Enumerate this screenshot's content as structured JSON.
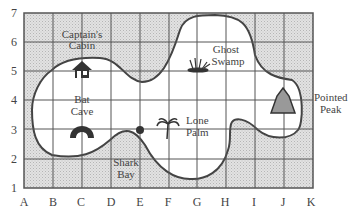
{
  "map": {
    "title": "",
    "grid": {
      "columns": [
        "A",
        "B",
        "C",
        "D",
        "E",
        "F",
        "G",
        "H",
        "I",
        "J",
        "K"
      ],
      "rows": [
        "1",
        "2",
        "3",
        "4",
        "5",
        "6",
        "7"
      ]
    },
    "landmarks": [
      {
        "id": "captains-cabin",
        "line1": "Captain's",
        "line2": "Cabin",
        "grid": "C5",
        "icon": "house-icon"
      },
      {
        "id": "bat-cave",
        "line1": "Bat",
        "line2": "Cave",
        "grid": "C3",
        "icon": "cave-icon"
      },
      {
        "id": "ghost-swamp",
        "line1": "Ghost",
        "line2": "Swamp",
        "grid": "G5",
        "icon": "swamp-grass-icon"
      },
      {
        "id": "lone-palm",
        "line1": "Lone",
        "line2": "Palm",
        "grid": "F3",
        "icon": "palm-tree-icon"
      },
      {
        "id": "pointed-peak",
        "line1": "Pointed",
        "line2": "Peak",
        "grid": "J4",
        "icon": "mountain-icon"
      },
      {
        "id": "shark-bay",
        "line1": "Shark",
        "line2": "Bay",
        "grid": "E2",
        "icon": ""
      },
      {
        "id": "marker-point",
        "line1": "",
        "line2": "",
        "grid": "E3",
        "icon": "dot-marker-icon"
      }
    ],
    "colors": {
      "water": "#d6d6d6",
      "land": "#ffffff",
      "grid": "#555555",
      "coast": "#444444"
    }
  }
}
